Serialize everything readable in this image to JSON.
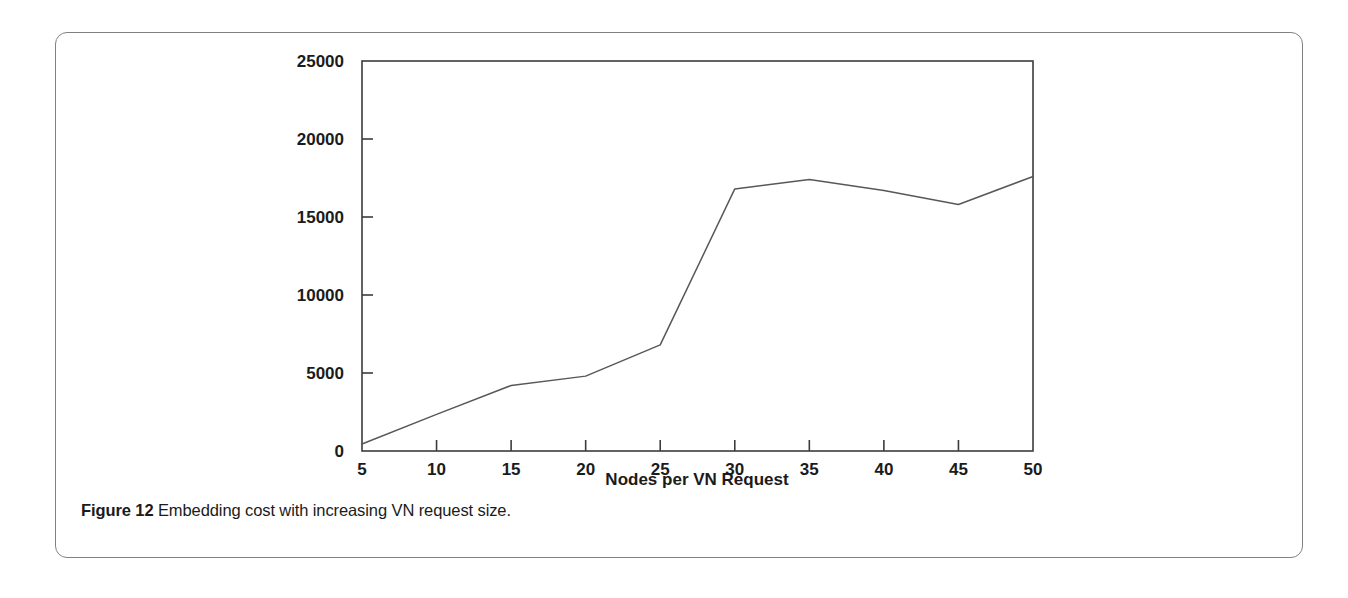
{
  "figure": {
    "caption_number": "Figure 12",
    "caption_text": "Embedding cost with increasing VN request size.",
    "border_color": "#7f8183"
  },
  "chart_data": {
    "type": "line",
    "title": "",
    "xlabel": "Nodes per VN Request",
    "ylabel": "",
    "x": [
      5,
      10,
      15,
      20,
      25,
      30,
      35,
      40,
      45,
      50
    ],
    "values": [
      450,
      2350,
      4200,
      4800,
      6800,
      16800,
      17400,
      16700,
      15800,
      17600
    ],
    "series": [
      {
        "name": "Embedding cost",
        "values": [
          450,
          2350,
          4200,
          4800,
          6800,
          16800,
          17400,
          16700,
          15800,
          17600
        ]
      }
    ],
    "xlim": [
      5,
      50
    ],
    "ylim": [
      0,
      25000
    ],
    "xticks": [
      5,
      10,
      15,
      20,
      25,
      30,
      35,
      40,
      45,
      50
    ],
    "xtick_labels": [
      "5",
      "10",
      "15",
      "20",
      "25",
      "30",
      "35",
      "40",
      "45",
      "50"
    ],
    "yticks": [
      0,
      5000,
      10000,
      15000,
      20000,
      25000
    ],
    "ytick_labels": [
      "0",
      "5000",
      "10000",
      "15000",
      "20000",
      "25000"
    ],
    "grid": false,
    "legend": false,
    "line_color": "#55585c",
    "frame_color": "#3a3c3e"
  }
}
